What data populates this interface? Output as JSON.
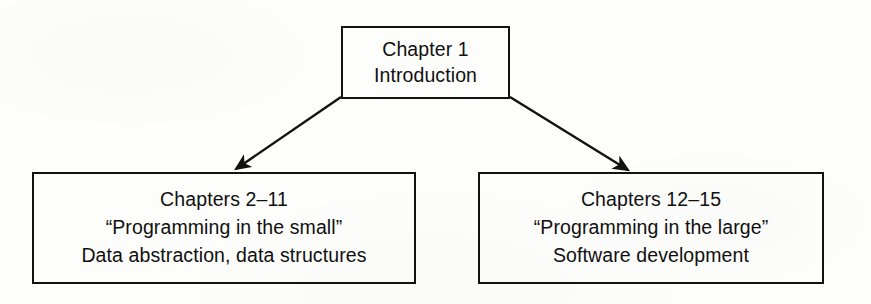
{
  "diagram": {
    "type": "tree-diagram",
    "background_color": "#fdfdfb",
    "line_color": "#121212",
    "text_color": "#101010",
    "nodes": [
      {
        "id": "root",
        "name": "chapter-1-node",
        "lines": [
          "Chapter 1",
          "Introduction"
        ]
      },
      {
        "id": "small",
        "name": "chapters-2-11-node",
        "lines": [
          "Chapters 2–11",
          "“Programming in the small”",
          "Data abstraction, data structures"
        ]
      },
      {
        "id": "large",
        "name": "chapters-12-15-node",
        "lines": [
          "Chapters 12–15",
          "“Programming in the large”",
          "Software development"
        ]
      }
    ],
    "edges": [
      {
        "name": "edge-root-to-small",
        "from": "root",
        "to": "small",
        "arrowhead": "filled-triangle"
      },
      {
        "name": "edge-root-to-large",
        "from": "root",
        "to": "large",
        "arrowhead": "filled-triangle"
      }
    ]
  }
}
